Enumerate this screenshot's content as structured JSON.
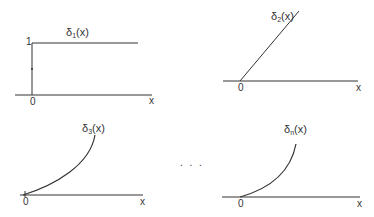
{
  "panels": [
    {
      "function_label": {
        "base": "δ",
        "subscript": "1",
        "arg": "(x)"
      },
      "y_tick": "1",
      "origin": "0",
      "x_axis": "x",
      "shape": "step"
    },
    {
      "function_label": {
        "base": "δ",
        "subscript": "2",
        "arg": "(x)"
      },
      "origin": "0",
      "x_axis": "x",
      "shape": "linear"
    },
    {
      "function_label": {
        "base": "δ",
        "subscript": "3",
        "arg": "(x)"
      },
      "origin": "0",
      "x_axis": "x",
      "shape": "convex-curve"
    },
    {
      "function_label": {
        "base": "δ",
        "subscript": "n",
        "arg": "(x)"
      },
      "origin": "0",
      "x_axis": "x",
      "shape": "convex-curve"
    }
  ],
  "ellipsis": ". . .",
  "colors": {
    "line": "#333333",
    "text": "#333333"
  }
}
